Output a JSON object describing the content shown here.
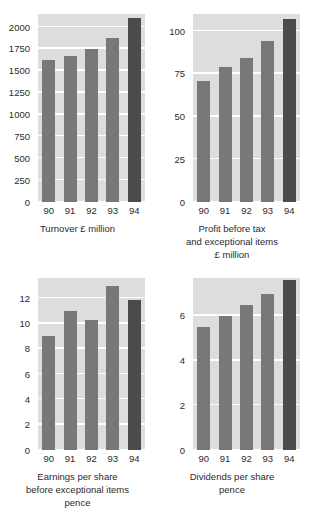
{
  "meta": {
    "axis_label_color": "#2b2b2b",
    "bar_color": "#787878",
    "bar_highlight_color": "#4b4b4b",
    "plot_background": "#dddddd",
    "gridline_color": "#ffffff"
  },
  "chart_data": [
    {
      "type": "bar",
      "title": "",
      "caption_lines": [
        "Turnover £ million"
      ],
      "xlabel": "",
      "ylabel": "",
      "categories": [
        "90",
        "91",
        "92",
        "93",
        "94"
      ],
      "values": [
        1620,
        1675,
        1745,
        1870,
        2100
      ],
      "yticks": [
        0,
        250,
        500,
        750,
        1000,
        1250,
        1500,
        1750,
        2000
      ],
      "ylim": [
        0,
        2150
      ],
      "grid": true,
      "legend": "none",
      "highlight_index": 4
    },
    {
      "type": "bar",
      "title": "",
      "caption_lines": [
        "Profit before tax",
        "and exceptional items",
        "£ million"
      ],
      "xlabel": "",
      "ylabel": "",
      "categories": [
        "90",
        "91",
        "92",
        "93",
        "94"
      ],
      "values": [
        71,
        79,
        84,
        94,
        107
      ],
      "yticks": [
        0,
        25,
        50,
        75,
        100
      ],
      "ylim": [
        0,
        110
      ],
      "grid": true,
      "legend": "none",
      "highlight_index": 4
    },
    {
      "type": "bar",
      "title": "",
      "caption_lines": [
        "Earnings per share",
        "before exceptional items",
        "pence"
      ],
      "xlabel": "",
      "ylabel": "",
      "categories": [
        "90",
        "91",
        "92",
        "93",
        "94"
      ],
      "values": [
        9.0,
        11.0,
        10.3,
        13.0,
        11.9
      ],
      "yticks": [
        0,
        2,
        4,
        6,
        8,
        10,
        12
      ],
      "ylim": [
        0,
        13.6
      ],
      "grid": true,
      "legend": "none",
      "highlight_index": 4
    },
    {
      "type": "bar",
      "title": "",
      "caption_lines": [
        "Dividends per share",
        "pence"
      ],
      "xlabel": "",
      "ylabel": "",
      "categories": [
        "90",
        "91",
        "92",
        "93",
        "94"
      ],
      "values": [
        5.5,
        6.0,
        6.5,
        7.0,
        7.6
      ],
      "yticks": [
        0,
        2,
        4,
        6
      ],
      "ylim": [
        0,
        7.7
      ],
      "grid": true,
      "legend": "none",
      "highlight_index": 4
    }
  ]
}
